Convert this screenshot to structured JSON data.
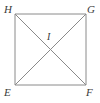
{
  "figure": {
    "kind": "geometry-diagram",
    "shape_name": "square-with-diagonals",
    "background_color": "#ffffff",
    "stroke_color": "#8a8a8a",
    "label_color": "#3a3a3a",
    "stroke_width": 1,
    "square": {
      "top_left": {
        "x": 15,
        "y": 14
      },
      "top_right": {
        "x": 86,
        "y": 14
      },
      "bottom_right": {
        "x": 86,
        "y": 85
      },
      "bottom_left": {
        "x": 15,
        "y": 85
      }
    },
    "diagonals": [
      {
        "name": "diagonal-H-F",
        "from": {
          "x": 15,
          "y": 14
        },
        "to": {
          "x": 86,
          "y": 85
        }
      },
      {
        "name": "diagonal-G-E",
        "from": {
          "x": 86,
          "y": 14
        },
        "to": {
          "x": 15,
          "y": 85
        }
      }
    ],
    "intersection_point": {
      "x": 50.5,
      "y": 49.5
    },
    "labels": {
      "top_left": "H",
      "top_right": "G",
      "bottom_left": "E",
      "bottom_right": "F",
      "center": "I"
    }
  }
}
